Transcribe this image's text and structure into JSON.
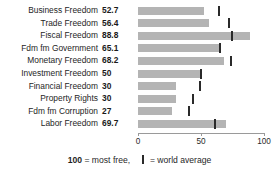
{
  "chart_data": {
    "type": "bar",
    "orientation": "horizontal",
    "title": "",
    "xlabel": "",
    "ylabel": "",
    "xlim": [
      0,
      100
    ],
    "grid": false,
    "categories": [
      "Business Freedom",
      "Trade Freedom",
      "Fiscal Freedom",
      "Fdm fm Government",
      "Monetary Freedom",
      "Investment Freedom",
      "Financial Freedom",
      "Property Rights",
      "Fdm fm Corruption",
      "Labor Freedom"
    ],
    "values": [
      52.7,
      56.4,
      88.8,
      65.1,
      68.2,
      50,
      30,
      30,
      27,
      69.7
    ],
    "value_labels": [
      "52.7",
      "56.4",
      "88.8",
      "65.1",
      "68.2",
      "50",
      "30",
      "30",
      "27",
      "69.7"
    ],
    "series": [
      {
        "name": "Country score",
        "values": [
          52.7,
          56.4,
          88.8,
          65.1,
          68.2,
          50,
          30,
          30,
          27,
          69.7
        ]
      },
      {
        "name": "World average",
        "values": [
          64.5,
          72.6,
          74.9,
          65.0,
          74.0,
          50.0,
          49.0,
          44.0,
          40.5,
          61.5
        ]
      }
    ],
    "ticks": [
      {
        "value": 0,
        "label": "0"
      },
      {
        "value": 50,
        "label": "50"
      },
      {
        "value": 100,
        "label": "100"
      }
    ],
    "legend": {
      "position": "bottom",
      "most_free_value": "100",
      "most_free_text": "= most free,",
      "world_average_text": "= world average",
      "marker_name": "world-average-marker"
    },
    "colors": {
      "bar": "#b4b4b4",
      "marker": "#2a2a2a",
      "axis": "#9a9a9a",
      "text": "#262626",
      "background": "#ffffff"
    }
  }
}
